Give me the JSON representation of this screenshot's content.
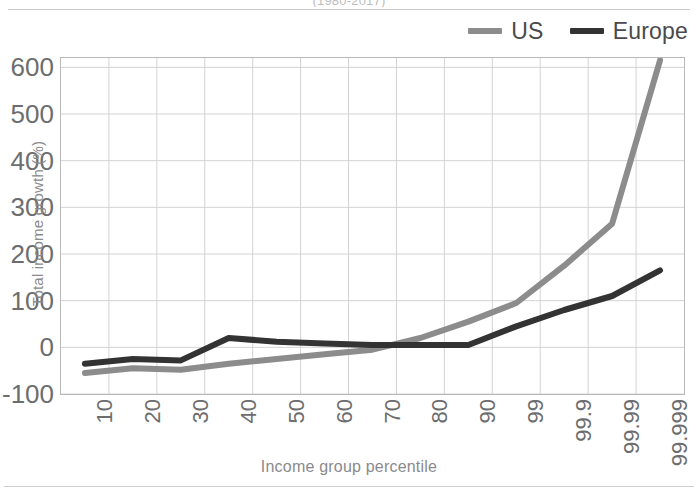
{
  "figure": {
    "title_partial": "(1980-2017)",
    "frame_color": "#b9b9b9",
    "background": "#ffffff"
  },
  "legend": {
    "position": "top-right",
    "items": [
      {
        "label": "US",
        "color": "#8c8c8c"
      },
      {
        "label": "Europe",
        "color": "#333333"
      }
    ]
  },
  "axes": {
    "ylabel": "Total income growth (%)",
    "xlabel": "Income group percentile"
  },
  "chart_data": {
    "type": "line",
    "title": "(1980-2017)",
    "xlabel": "Income group percentile",
    "ylabel": "Total income growth (%)",
    "categories": [
      "10",
      "20",
      "30",
      "40",
      "50",
      "60",
      "70",
      "80",
      "90",
      "99",
      "99.9",
      "99.99",
      "99.999"
    ],
    "ylim": [
      -100,
      620
    ],
    "yticks": [
      600,
      500,
      400,
      300,
      200,
      100,
      0,
      -100
    ],
    "ytick_labels": [
      "600",
      "500",
      "400",
      "300",
      "200",
      "100",
      "0",
      "-100"
    ],
    "grid": true,
    "legend_position": "top-right",
    "series": [
      {
        "name": "US",
        "color": "#8c8c8c",
        "values": [
          -55,
          -45,
          -48,
          -35,
          -25,
          -15,
          -5,
          20,
          55,
          95,
          175,
          265,
          615
        ]
      },
      {
        "name": "Europe",
        "color": "#333333",
        "values": [
          -35,
          -25,
          -28,
          20,
          12,
          8,
          5,
          5,
          5,
          45,
          80,
          110,
          165
        ]
      }
    ]
  }
}
